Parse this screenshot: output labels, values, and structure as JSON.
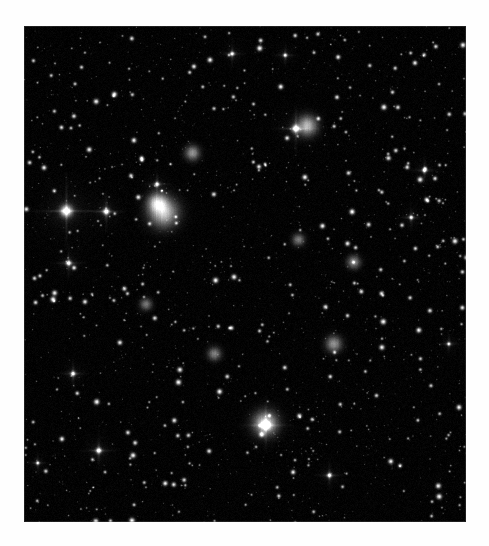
{
  "page": {
    "background_color": "#fefefe",
    "caption": ""
  },
  "image": {
    "name": "spiral-galaxy-plate",
    "kind": "astronomical-photograph",
    "subject": "face-on spiral galaxy",
    "palette": "grayscale",
    "background_color": "#040404",
    "plate": {
      "x": 24,
      "y": 26,
      "width": 442,
      "height": 496
    },
    "galaxy": {
      "nucleus": {
        "x": 0.5,
        "y": 0.525,
        "brightness": 1.0
      },
      "disk": {
        "cx": 0.5,
        "cy": 0.525,
        "rx": 0.4,
        "ry": 0.5,
        "tilt_deg": -12
      },
      "arm_count": 4,
      "arm_pitch": 0.46,
      "dust_lane_strength": 0.55,
      "halo_falloff": 2.3
    },
    "hii_regions": [
      {
        "x": 0.315,
        "y": 0.375,
        "r": 0.022,
        "b": 0.95
      },
      {
        "x": 0.3,
        "y": 0.355,
        "r": 0.014,
        "b": 0.8
      },
      {
        "x": 0.64,
        "y": 0.2,
        "r": 0.015,
        "b": 0.85
      },
      {
        "x": 0.545,
        "y": 0.8,
        "r": 0.018,
        "b": 0.9
      },
      {
        "x": 0.7,
        "y": 0.64,
        "r": 0.012,
        "b": 0.7
      },
      {
        "x": 0.38,
        "y": 0.255,
        "r": 0.011,
        "b": 0.7
      },
      {
        "x": 0.745,
        "y": 0.475,
        "r": 0.01,
        "b": 0.65
      },
      {
        "x": 0.43,
        "y": 0.66,
        "r": 0.01,
        "b": 0.62
      },
      {
        "x": 0.62,
        "y": 0.43,
        "r": 0.009,
        "b": 0.6
      },
      {
        "x": 0.275,
        "y": 0.56,
        "r": 0.009,
        "b": 0.58
      }
    ],
    "bright_stars": [
      {
        "x": 0.095,
        "y": 0.372,
        "r": 7.5,
        "b": 1.0
      },
      {
        "x": 0.185,
        "y": 0.373,
        "r": 4.2,
        "b": 0.88
      },
      {
        "x": 0.546,
        "y": 0.804,
        "r": 5.6,
        "b": 0.96
      },
      {
        "x": 0.614,
        "y": 0.206,
        "r": 4.8,
        "b": 0.92
      },
      {
        "x": 0.1,
        "y": 0.477,
        "r": 3.6,
        "b": 0.82
      },
      {
        "x": 0.11,
        "y": 0.7,
        "r": 3.2,
        "b": 0.78
      },
      {
        "x": 0.168,
        "y": 0.855,
        "r": 3.8,
        "b": 0.84
      },
      {
        "x": 0.905,
        "y": 0.29,
        "r": 3.0,
        "b": 0.76
      },
      {
        "x": 0.875,
        "y": 0.385,
        "r": 2.8,
        "b": 0.72
      },
      {
        "x": 0.47,
        "y": 0.055,
        "r": 2.9,
        "b": 0.74
      },
      {
        "x": 0.59,
        "y": 0.058,
        "r": 2.6,
        "b": 0.7
      },
      {
        "x": 0.69,
        "y": 0.905,
        "r": 3.1,
        "b": 0.78
      },
      {
        "x": 0.96,
        "y": 0.64,
        "r": 2.5,
        "b": 0.68
      },
      {
        "x": 0.3,
        "y": 0.318,
        "r": 3.0,
        "b": 0.8
      },
      {
        "x": 0.03,
        "y": 0.88,
        "r": 2.4,
        "b": 0.66
      }
    ],
    "star_field": {
      "count": 1500,
      "seed": 20231117
    },
    "noise": {
      "sigma": 7,
      "vertical_streaks": true
    }
  }
}
